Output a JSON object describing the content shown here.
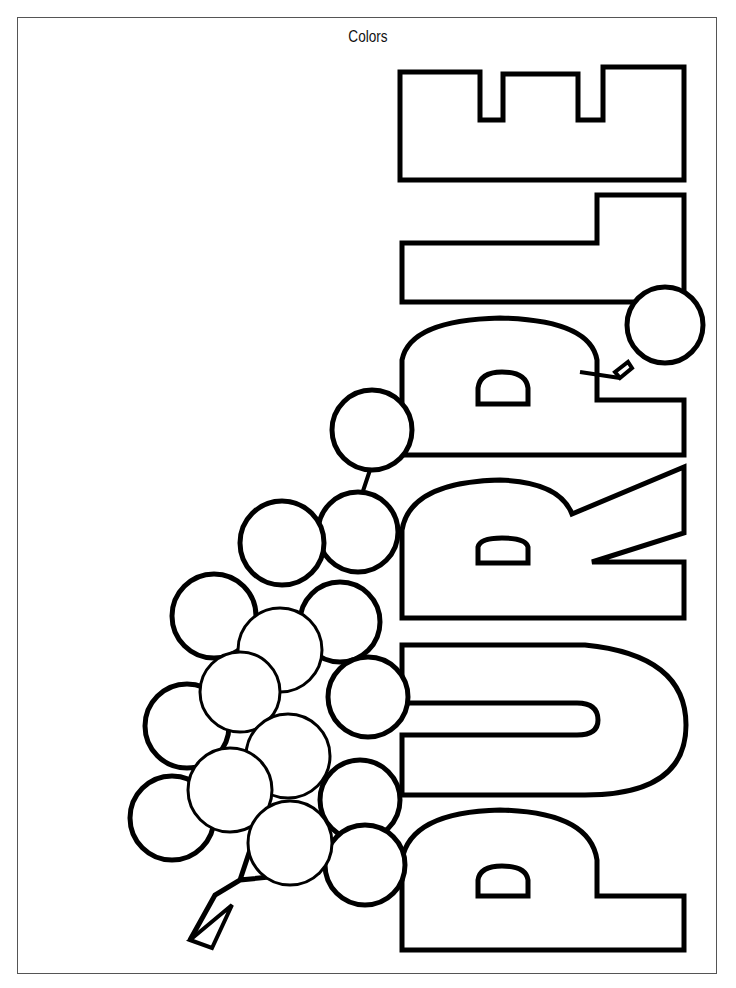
{
  "page": {
    "title": "Colors",
    "word": "PURPLE",
    "letters": [
      "P",
      "U",
      "R",
      "P",
      "L",
      "E"
    ],
    "illustration": "grape-cluster",
    "grape_count": 18,
    "colors": {
      "outline": "#000000",
      "background": "#ffffff",
      "frame": "#555555"
    }
  }
}
